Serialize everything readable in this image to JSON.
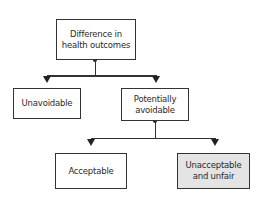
{
  "diagram": {
    "type": "tree",
    "nodes": {
      "root": {
        "label": "Difference in\nhealth outcomes"
      },
      "unavoidable": {
        "label": "Unavoidable"
      },
      "potentially_avoidable": {
        "label": "Potentially\navoidable"
      },
      "acceptable": {
        "label": "Acceptable"
      },
      "unacceptable": {
        "label": "Unacceptable\nand unfair",
        "highlighted": true
      }
    },
    "edges": [
      {
        "from": "root",
        "to": "unavoidable"
      },
      {
        "from": "root",
        "to": "potentially_avoidable"
      },
      {
        "from": "potentially_avoidable",
        "to": "acceptable"
      },
      {
        "from": "potentially_avoidable",
        "to": "unacceptable"
      }
    ],
    "colors": {
      "stroke": "#333333",
      "highlight_fill": "#e4e4e4",
      "background": "#ffffff"
    }
  }
}
